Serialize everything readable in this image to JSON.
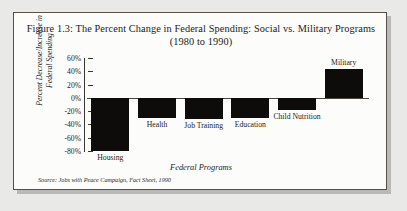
{
  "figure": {
    "title_line1": "Figure 1.3: The Percent Change in Federal Spending: Social vs. Military Programs",
    "title_line2": "(1980 to 1990)",
    "source": "Source: Jobs with Peace Campaign, Fact Sheet, 1990"
  },
  "chart_data": {
    "type": "bar",
    "title": "Figure 1.3: The Percent Change in Federal Spending: Social vs. Military Programs (1980 to 1990)",
    "xlabel": "Federal Programs",
    "ylabel": "Percent Decrease/Increase in Federal Spending",
    "categories": [
      "Housing",
      "Health",
      "Job Training",
      "Education",
      "Child Nutrition",
      "Military"
    ],
    "values": [
      -80,
      -30,
      -32,
      -30,
      -18,
      44
    ],
    "value_labels": [
      "-80%",
      "-30%",
      "-32%",
      "-30%",
      "-18%",
      "+44%"
    ],
    "ylim": [
      -80,
      60
    ],
    "ytick_labels": [
      "60%",
      "40%",
      "20%",
      "0%",
      "-20%",
      "-40%",
      "-60%",
      "-80%"
    ],
    "ytick_values": [
      60,
      40,
      20,
      0,
      -20,
      -40,
      -60,
      -80
    ],
    "grid": false,
    "legend": "none",
    "bar_color": "#0d0c0b",
    "source": "Source: Jobs with Peace Campaign, Fact Sheet, 1990"
  }
}
